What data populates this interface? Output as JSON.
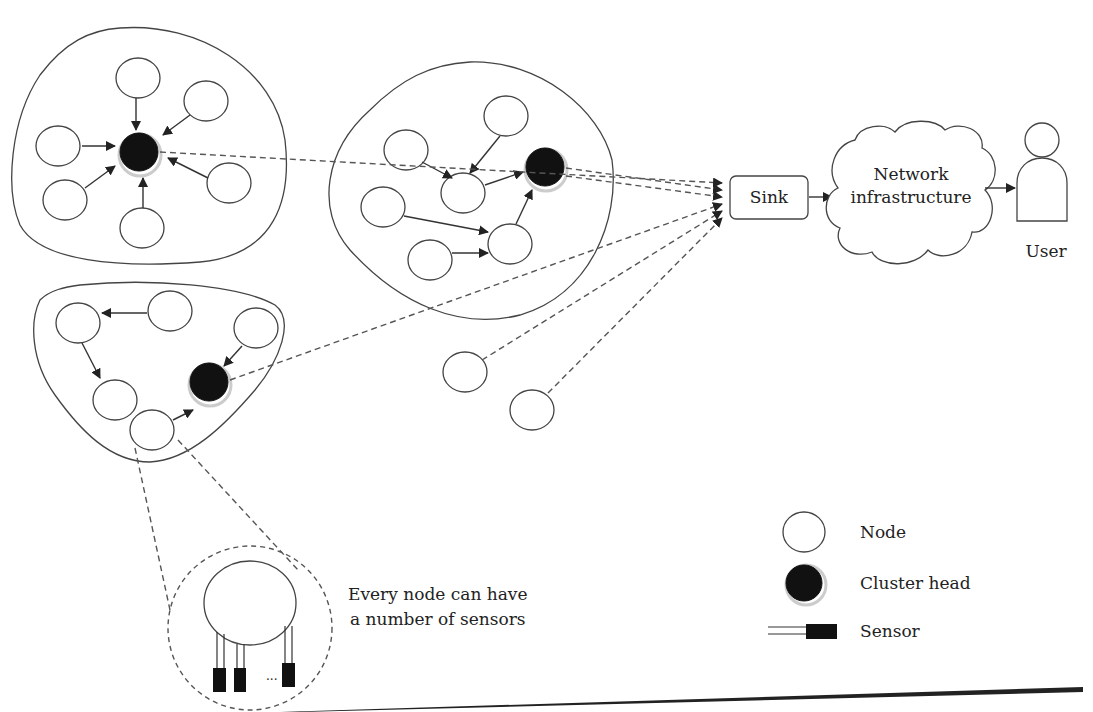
{
  "diagram": {
    "components": {
      "sink": {
        "label": "Sink"
      },
      "cloud": {
        "label_line1": "Network",
        "label_line2": "infrastructure"
      },
      "user": {
        "label": "User"
      }
    },
    "callout": {
      "line1": "Every node can have",
      "line2": "a number of sensors",
      "ellipsis": "..."
    },
    "legend": {
      "items": [
        {
          "icon": "node-icon",
          "label": "Node"
        },
        {
          "icon": "cluster-head-icon",
          "label": "Cluster head"
        },
        {
          "icon": "sensor-icon",
          "label": "Sensor"
        }
      ]
    },
    "clusters": [
      {
        "name": "cluster-1",
        "member_nodes": 6,
        "has_cluster_head": true
      },
      {
        "name": "cluster-2",
        "member_nodes": 6,
        "has_cluster_head": true
      },
      {
        "name": "cluster-3",
        "member_nodes": 5,
        "has_cluster_head": true
      }
    ],
    "standalone_nodes": 2,
    "colors": {
      "stroke": "#444444",
      "cluster_head": "#111111",
      "background": "#ffffff"
    }
  }
}
